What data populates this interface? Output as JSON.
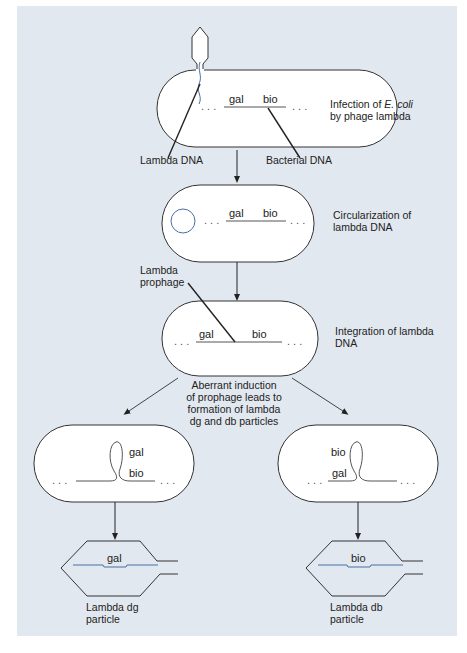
{
  "colors": {
    "panel_bg": "#e2e8f0",
    "cell_fill": "#ffffff",
    "outline": "#333333",
    "lambda_dna": "#4a6fa5",
    "bacterial_dna": "#333333"
  },
  "steps": {
    "infection": {
      "caption_line1_prefix": "Infection of ",
      "caption_line1_italic": "E. coli",
      "caption_line2": "by phage lambda",
      "gene_left": "gal",
      "gene_right": "bio",
      "callout_left": "Lambda DNA",
      "callout_right": "Bacterial DNA"
    },
    "circularization": {
      "caption_line1": "Circularization of",
      "caption_line2": "lambda DNA",
      "gene_left": "gal",
      "gene_right": "bio"
    },
    "integration": {
      "callout_line1": "Lambda",
      "callout_line2": "prophage",
      "caption_line1": "Integration of lambda",
      "caption_line2": "DNA",
      "gene_left": "gal",
      "gene_right": "bio"
    },
    "aberrant": {
      "line1": "Aberrant induction",
      "line2": "of prophage leads to",
      "line3": "formation of lambda",
      "line4": "dg and db particles"
    },
    "dg_branch": {
      "gene_top": "gal",
      "gene_bottom": "bio",
      "particle_gene": "gal",
      "particle_label_line1": "Lambda dg",
      "particle_label_line2": "particle"
    },
    "db_branch": {
      "gene_top": "bio",
      "gene_bottom": "gal",
      "particle_gene": "bio",
      "particle_label_line1": "Lambda db",
      "particle_label_line2": "particle"
    }
  },
  "dots": ". . ."
}
